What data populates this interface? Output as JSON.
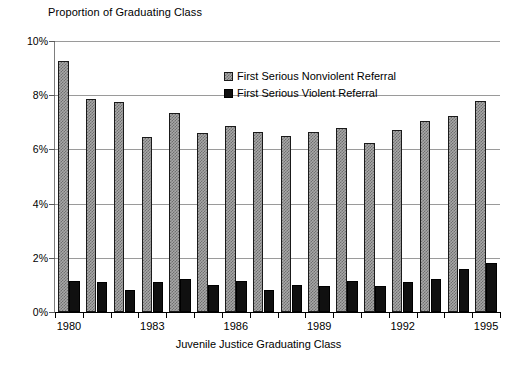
{
  "chart_data": {
    "type": "bar",
    "title": "Proportion of Graduating Class",
    "xlabel": "Juvenile Justice Graduating Class",
    "ylabel": "",
    "grid": true,
    "legend_position": "inside-top-right",
    "ylim": [
      0,
      10
    ],
    "ytick_labels": [
      "0%",
      "2%",
      "4%",
      "6%",
      "8%",
      "10%"
    ],
    "ytick_values": [
      0,
      2,
      4,
      6,
      8,
      10
    ],
    "categories": [
      1980,
      1981,
      1982,
      1983,
      1984,
      1985,
      1986,
      1987,
      1988,
      1989,
      1990,
      1991,
      1992,
      1993,
      1994,
      1995
    ],
    "xtick_labels": [
      "1980",
      "1983",
      "1986",
      "1989",
      "1992",
      "1995"
    ],
    "xtick_values": [
      1980,
      1983,
      1986,
      1989,
      1992,
      1995
    ],
    "series": [
      {
        "name": "First Serious Nonviolent Referral",
        "color": "#a8a8a8",
        "values": [
          9.25,
          7.85,
          7.75,
          6.45,
          7.35,
          6.6,
          6.85,
          6.65,
          6.5,
          6.65,
          6.8,
          6.25,
          6.7,
          7.05,
          7.25,
          7.8
        ]
      },
      {
        "name": "First Serious Violent Referral",
        "color": "#101010",
        "values": [
          1.15,
          1.1,
          0.8,
          1.1,
          1.2,
          1.0,
          1.15,
          0.8,
          1.0,
          0.95,
          1.15,
          0.95,
          1.1,
          1.2,
          1.6,
          1.8
        ]
      }
    ]
  }
}
